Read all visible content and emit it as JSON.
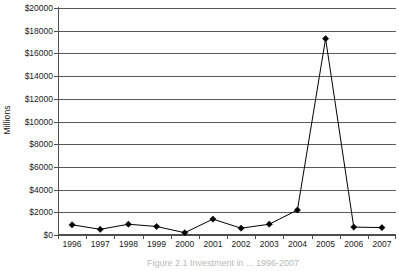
{
  "chart_data": {
    "type": "line",
    "title": "",
    "subtitle": "",
    "xlabel": "",
    "ylabel": "Millions",
    "categories": [
      "1996",
      "1997",
      "1998",
      "1999",
      "2000",
      "2001",
      "2002",
      "2003",
      "2004",
      "2005",
      "2006",
      "2007"
    ],
    "values": [
      900,
      500,
      950,
      750,
      200,
      1400,
      600,
      950,
      2200,
      17300,
      700,
      650
    ],
    "series": [
      {
        "name": "",
        "values": [
          900,
          500,
          950,
          750,
          200,
          1400,
          600,
          950,
          2200,
          17300,
          700,
          650
        ]
      }
    ],
    "ylim": [
      0,
      20000
    ],
    "ytick_step": 2000,
    "ytick_labels": [
      "$0",
      "$2000",
      "$4000",
      "$6000",
      "$8000",
      "$10000",
      "$12000",
      "$14000",
      "$16000",
      "$18000",
      "$20000"
    ],
    "ytick_values": [
      0,
      2000,
      4000,
      6000,
      8000,
      10000,
      12000,
      14000,
      16000,
      18000,
      20000
    ],
    "grid": true,
    "grid_axis": "y",
    "legend": false,
    "legend_position": "none",
    "marker": "diamond",
    "marker_color": "#000000",
    "line_color": "#000000",
    "annotations": []
  },
  "figure": {
    "caption": "Figure 2.1 Investment in ... 1996-2007",
    "axis_color": "#4d4d4d",
    "grid_color": "#5a5a5a",
    "background": "#ffffff"
  }
}
